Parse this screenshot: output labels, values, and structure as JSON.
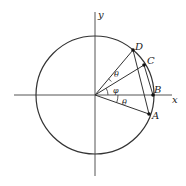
{
  "diagram": {
    "type": "unit-circle-angles",
    "axes": {
      "x_label": "x",
      "y_label": "y"
    },
    "points": [
      {
        "name": "A",
        "label": "A"
      },
      {
        "name": "B",
        "label": "B"
      },
      {
        "name": "C",
        "label": "C"
      },
      {
        "name": "D",
        "label": "D"
      }
    ],
    "angles": [
      {
        "name": "theta-top",
        "label": "θ",
        "between": "OC-OD"
      },
      {
        "name": "phi",
        "label": "φ",
        "between": "OB-OC"
      },
      {
        "name": "theta-bottom",
        "label": "θ",
        "between": "OA-OB"
      }
    ],
    "chords": [
      "DA",
      "CB"
    ],
    "colors": {
      "stroke": "#333333",
      "point": "#111111"
    }
  }
}
